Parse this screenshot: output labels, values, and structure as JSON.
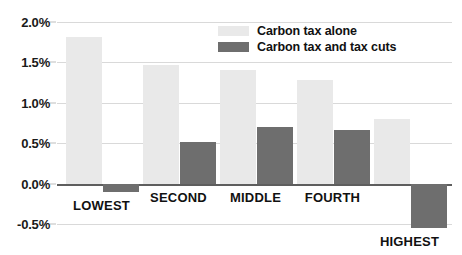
{
  "chart_data": {
    "type": "bar",
    "title": "",
    "subtitle": "",
    "xlabel": "",
    "ylabel": "",
    "categories": [
      "LOWEST",
      "SECOND",
      "MIDDLE",
      "FOURTH",
      "HIGHEST"
    ],
    "series": [
      {
        "name": "Carbon tax alone",
        "color": "#e9e9e9",
        "values": [
          1.81,
          1.47,
          1.4,
          1.28,
          0.8
        ]
      },
      {
        "name": "Carbon tax and tax cuts",
        "color": "#6e6e6e",
        "values": [
          -0.1,
          0.52,
          0.7,
          0.66,
          -0.55
        ]
      }
    ],
    "ylim": [
      -0.5,
      2.0
    ],
    "yticks": [
      2.0,
      1.5,
      1.0,
      0.5,
      0.0,
      -0.5
    ],
    "ytick_labels": [
      "2.0%",
      "1.5%",
      "1.0%",
      "0.5%",
      "0.0%",
      "-0.5%"
    ],
    "grid": true,
    "legend_position": "top-right",
    "value_format": "percent",
    "zero_line": 0.0
  },
  "legend": {
    "items": [
      {
        "label": "Carbon tax alone",
        "swatch": "light"
      },
      {
        "label": "Carbon tax and tax cuts",
        "swatch": "dark"
      }
    ]
  },
  "colors": {
    "series_light": "#e9e9e9",
    "series_dark": "#6e6e6e",
    "gridline": "#d9d9d9",
    "zero_line": "#5e5e5e",
    "text": "#111111",
    "background": "#ffffff"
  }
}
